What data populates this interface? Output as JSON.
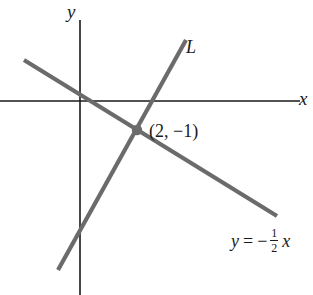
{
  "figure": {
    "background_color": "#ffffff",
    "width": 313,
    "height": 295
  },
  "axes": {
    "color": "#1a1a1a",
    "x_label": "x",
    "y_label": "y",
    "origin": {
      "x": 80,
      "y": 101
    },
    "x_axis": {
      "x1": 0,
      "y1": 101,
      "x2": 300,
      "y2": 101
    },
    "y_axis": {
      "x1": 80,
      "y1": 20,
      "x2": 80,
      "y2": 295
    }
  },
  "labels": {
    "line_L": "L",
    "point": "(2, −1)",
    "equation_y": "y",
    "equation_equals": "=",
    "equation_minus": "−",
    "equation_numerator": "1",
    "equation_denominator": "2",
    "equation_variable": "x"
  },
  "chart_data": {
    "type": "line",
    "title": "",
    "xlabel": "x",
    "ylabel": "y",
    "grid": false,
    "legend": "none",
    "line_color": "#6b6b6b",
    "line_width": 4,
    "point_color": "#6b6b6b",
    "series": [
      {
        "name": "L",
        "label": "L",
        "label_position": {
          "x": 186,
          "y": 38
        },
        "pixel_endpoints": {
          "x1": 58,
          "y1": 270,
          "x2": 186,
          "y2": 40
        },
        "description": "steep ascending line through (2, -1)"
      },
      {
        "name": "y = -1/2 x",
        "label": "y = −½ x",
        "label_position": {
          "x": 231,
          "y": 227
        },
        "pixel_endpoints": {
          "x1": 24,
          "y1": 60,
          "x2": 277,
          "y2": 216
        },
        "slope": -0.5,
        "intercept": 0,
        "description": "descending line through the origin with slope -1/2"
      }
    ],
    "points": [
      {
        "label": "(2, −1)",
        "x": 2,
        "y": -1,
        "pixel": {
          "x": 137,
          "y": 130
        },
        "radius": 5
      }
    ]
  }
}
